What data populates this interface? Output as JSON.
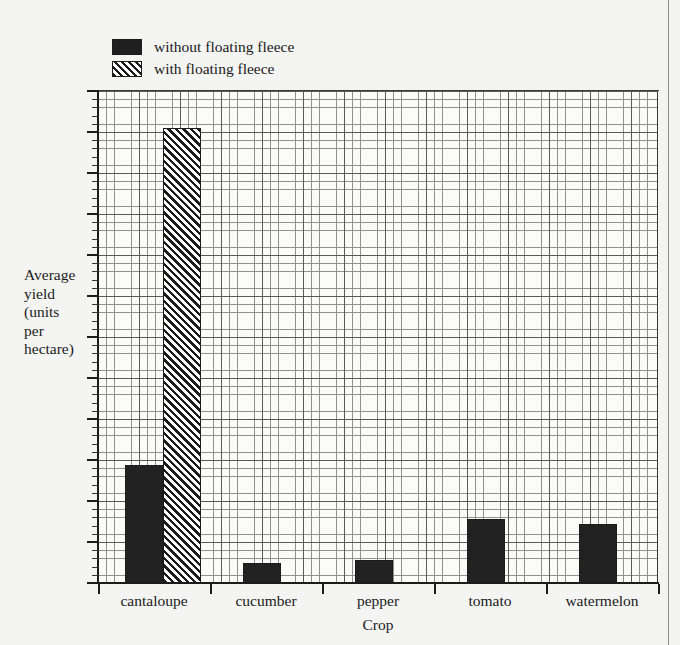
{
  "chart_data": {
    "type": "bar",
    "title": "",
    "subtitle": "",
    "xlabel": "Crop",
    "ylabel": "Average yield (units per hectare)",
    "ylabel_lines": [
      "Average",
      "yield",
      "(units",
      "per",
      "hectare)"
    ],
    "categories": [
      "cantaloupe",
      "cucumber",
      "pepper",
      "tomato",
      "watermelon"
    ],
    "series": [
      {
        "name": "without floating fleece",
        "style": "solid",
        "values": [
          2.88,
          0.49,
          0.56,
          1.56,
          1.44
        ]
      },
      {
        "name": "with floating fleece",
        "style": "hatched",
        "values": [
          11.1,
          0,
          0,
          0,
          0
        ]
      }
    ],
    "ylim": [
      0,
      12
    ],
    "y_tick_labels": [],
    "y_major_interval": 1,
    "y_minor_per_major": 5,
    "grid": true,
    "grid_style": "fine mesh, major lines every 5 minor cells",
    "legend_position": "above plot, upper left"
  },
  "legend": {
    "items": [
      {
        "label": "without floating fleece",
        "swatch": "solid-black"
      },
      {
        "label": "with floating fleece",
        "swatch": "diagonal-hatch"
      }
    ]
  },
  "axes": {
    "y_title_lines": [
      "Average",
      "yield",
      "(units",
      "per",
      "hectare)"
    ],
    "x_title": "Crop",
    "x_tick_labels": [
      "cantaloupe",
      "cucumber",
      "pepper",
      "tomato",
      "watermelon"
    ]
  },
  "colors": {
    "page_background": "#f4f4f2",
    "plot_background": "#fbfbfa",
    "bar_fill": "#222222",
    "ink": "#1b1b1b",
    "grid_major": "#5a5a5a",
    "grid_minor": "#909090"
  }
}
